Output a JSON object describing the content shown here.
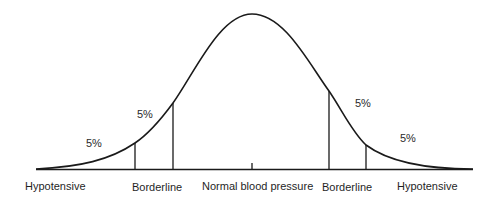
{
  "diagram": {
    "type": "normal-distribution-curve",
    "colors": {
      "line": "#1a1a1a",
      "background": "#ffffff"
    },
    "axis_labels": [
      {
        "id": "left-hypotensive",
        "text": "Hypotensive"
      },
      {
        "id": "left-borderline",
        "text": "Borderline"
      },
      {
        "id": "center-normal",
        "text": "Normal blood pressure"
      },
      {
        "id": "right-borderline",
        "text": "Borderline"
      },
      {
        "id": "right-hypotensive",
        "text": "Hypotensive"
      }
    ],
    "region_percentages": [
      {
        "id": "left-outer",
        "text": "5%"
      },
      {
        "id": "left-inner",
        "text": "5%"
      },
      {
        "id": "right-inner",
        "text": "5%"
      },
      {
        "id": "right-outer",
        "text": "5%"
      }
    ]
  }
}
